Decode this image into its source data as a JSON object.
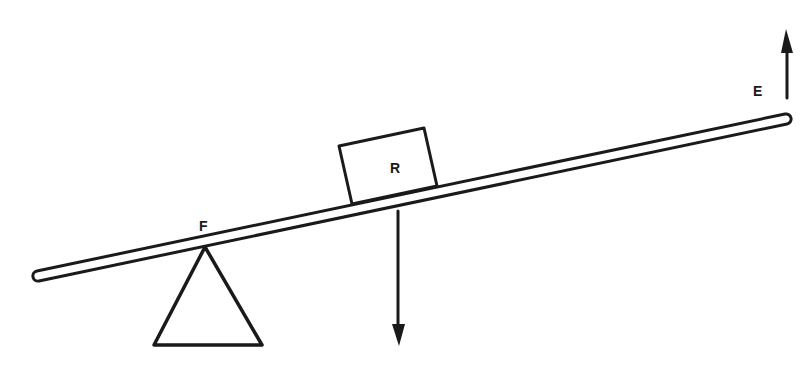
{
  "diagram": {
    "type": "lever",
    "labels": {
      "fulcrum": "F",
      "load": "R",
      "effort": "E"
    },
    "forces": [
      {
        "name": "load",
        "label": "R",
        "direction": "down"
      },
      {
        "name": "effort",
        "label": "E",
        "direction": "up"
      }
    ],
    "colors": {
      "ink": "#1a1a1a",
      "background": "#ffffff"
    }
  }
}
